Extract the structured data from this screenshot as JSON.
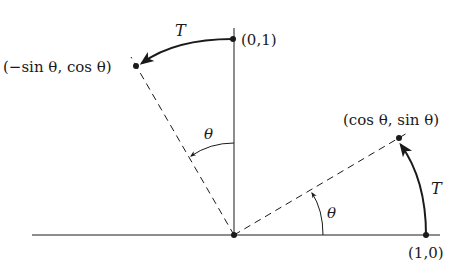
{
  "diagram": {
    "title": "",
    "colors": {
      "ink": "#1a1a1a",
      "background": "#ffffff"
    },
    "origin": {
      "x": 234,
      "y": 235
    },
    "points": [
      {
        "id": "e2",
        "label": "(0,1)",
        "x": 233,
        "y": 39
      },
      {
        "id": "Te2",
        "label": "(−sin θ, cos θ)",
        "x": 136,
        "y": 66
      },
      {
        "id": "Te1",
        "label": "(cos θ, sin θ)",
        "x": 399,
        "y": 138
      },
      {
        "id": "e1",
        "label": "(1,0)",
        "x": 426,
        "y": 235
      }
    ],
    "labels": {
      "e2": "(0,1)",
      "Te2": "(−sin θ, cos θ)",
      "Te1": "(cos θ, sin θ)",
      "e1": "(1,0)",
      "T_top": "T",
      "T_right": "T",
      "theta_upper": "θ",
      "theta_lower": "θ"
    },
    "arrows": [
      {
        "id": "T-top",
        "from": "e2",
        "to": "Te2",
        "label": "T",
        "style": "thick-curved"
      },
      {
        "id": "T-right",
        "from": "e1",
        "to": "Te1",
        "label": "T",
        "style": "thick-curved"
      },
      {
        "id": "theta-upper",
        "label": "θ",
        "style": "thin-arc"
      },
      {
        "id": "theta-lower",
        "label": "θ",
        "style": "thin-arc"
      }
    ]
  }
}
